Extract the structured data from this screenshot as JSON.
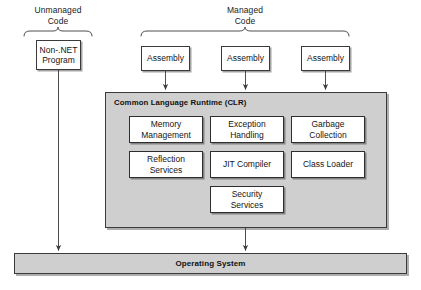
{
  "diagram": {
    "colors": {
      "container_fill": "#cfcfcf",
      "box_fill": "#ffffff",
      "stroke": "#3a3a3a",
      "text": "#151515"
    },
    "group_labels": {
      "unmanaged": "Unmanaged\nCode",
      "unmanaged_line1": "Unmanaged",
      "unmanaged_line2": "Code",
      "managed_line1": "Managed",
      "managed_line2": "Code"
    },
    "unmanaged_box": {
      "line1": "Non-.NET",
      "line2": "Program"
    },
    "assemblies": [
      {
        "label": "Assembly"
      },
      {
        "label": "Assembly"
      },
      {
        "label": "Assembly"
      }
    ],
    "clr": {
      "title": "Common Language Runtime (CLR)",
      "services": [
        {
          "line1": "Memory",
          "line2": "Management"
        },
        {
          "line1": "Exception",
          "line2": "Handling"
        },
        {
          "line1": "Garbage",
          "line2": "Collection"
        },
        {
          "line1": "Reflection",
          "line2": "Services"
        },
        {
          "line1": "JIT Compiler",
          "line2": ""
        },
        {
          "line1": "Class Loader",
          "line2": ""
        },
        {
          "line1": "Security",
          "line2": "Services"
        }
      ]
    },
    "operating_system": {
      "label": "Operating System"
    },
    "caption": ""
  }
}
